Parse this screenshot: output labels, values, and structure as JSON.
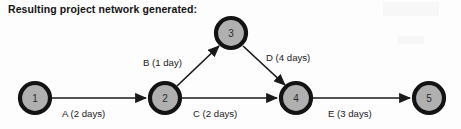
{
  "title": "Resulting project network generated:",
  "diagram": {
    "kind": "project-network",
    "node_fill": "#b0b0b0",
    "node_stroke": "#131313",
    "edge_color": "#1a1a1a",
    "background": "#fdfdfd",
    "nodes": [
      {
        "id": "1",
        "label": "1",
        "cx": 35,
        "cy": 98,
        "r": 15
      },
      {
        "id": "2",
        "label": "2",
        "cx": 165,
        "cy": 98,
        "r": 15
      },
      {
        "id": "3",
        "label": "3",
        "cx": 231,
        "cy": 33,
        "r": 15
      },
      {
        "id": "4",
        "label": "4",
        "cx": 296,
        "cy": 98,
        "r": 15
      },
      {
        "id": "5",
        "label": "5",
        "cx": 429,
        "cy": 98,
        "r": 15
      }
    ],
    "edges": [
      {
        "id": "A",
        "from": "1",
        "to": "2",
        "activity": "A",
        "duration_days": 2,
        "label": "A (2 days)",
        "label_x": 62,
        "label_y": 117
      },
      {
        "id": "B",
        "from": "2",
        "to": "3",
        "activity": "B",
        "duration_days": 1,
        "label": "B (1 day)",
        "label_x": 143,
        "label_y": 66
      },
      {
        "id": "C",
        "from": "2",
        "to": "4",
        "activity": "C",
        "duration_days": 2,
        "label": "C (2 days)",
        "label_x": 193,
        "label_y": 117
      },
      {
        "id": "D",
        "from": "3",
        "to": "4",
        "activity": "D",
        "duration_days": 4,
        "label": "D (4 days)",
        "label_x": 266,
        "label_y": 61
      },
      {
        "id": "E",
        "from": "4",
        "to": "5",
        "activity": "E",
        "duration_days": 3,
        "label": "E (3 days)",
        "label_x": 328,
        "label_y": 117
      }
    ]
  }
}
